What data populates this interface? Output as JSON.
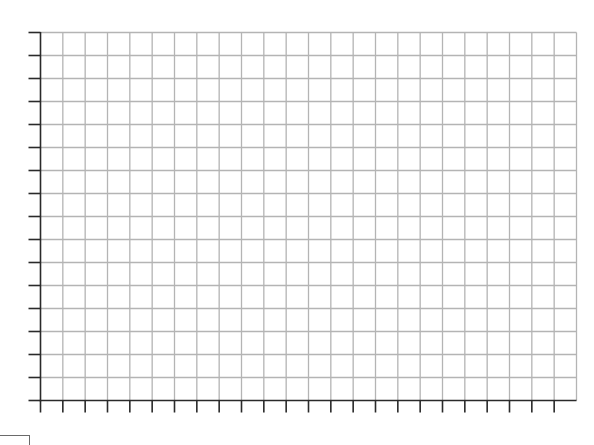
{
  "figure": {
    "type": "blank-graph-grid",
    "columns": 24,
    "rows": 16,
    "x_ticks": 24,
    "y_ticks": 17,
    "grid_color": "#b4b4b4",
    "axis_color": "#2a2a2a",
    "background": "#ffffff"
  },
  "layout": {
    "left": 40.5,
    "top": 32.5,
    "right": 576.5,
    "bottom": 400.5,
    "tick_length": 12
  }
}
